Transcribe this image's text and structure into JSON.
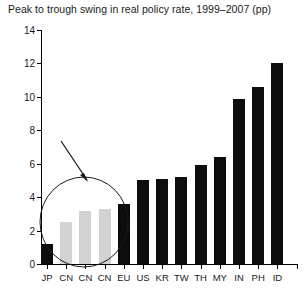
{
  "chart_data": {
    "type": "bar",
    "title": "Peak to trough swing in real policy rate, 1999–2007 (pp)",
    "xlabel": "",
    "ylabel": "",
    "ylim": [
      0,
      14
    ],
    "yticks": [
      0,
      2,
      4,
      6,
      8,
      10,
      12,
      14
    ],
    "grid": false,
    "legend": "none",
    "categories": [
      "JP",
      "CN",
      "CN",
      "CN",
      "EU",
      "US",
      "KR",
      "TW",
      "TH",
      "MY",
      "IN",
      "PH",
      "ID"
    ],
    "values": [
      1.2,
      2.5,
      3.2,
      3.3,
      3.6,
      5.0,
      5.1,
      5.2,
      5.9,
      6.4,
      9.9,
      10.6,
      12.0
    ],
    "bar_colors": [
      "#0d0d0d",
      "#d2d2d2",
      "#d2d2d2",
      "#d2d2d2",
      "#0d0d0d",
      "#0d0d0d",
      "#0d0d0d",
      "#0d0d0d",
      "#0d0d0d",
      "#0d0d0d",
      "#0d0d0d",
      "#0d0d0d",
      "#0d0d0d"
    ],
    "annotations": [
      {
        "kind": "ellipse",
        "label": "highlight-ellipse",
        "encircles": [
          "JP",
          "CN",
          "CN",
          "CN"
        ]
      },
      {
        "kind": "arrow",
        "label": "callout-arrow",
        "points_to": "highlight-ellipse"
      }
    ]
  },
  "colors": {
    "bar_dark": "#0d0d0d",
    "bar_light": "#d2d2d2",
    "axis": "#000000",
    "text": "#1a1a1a",
    "background": "#ffffff"
  }
}
